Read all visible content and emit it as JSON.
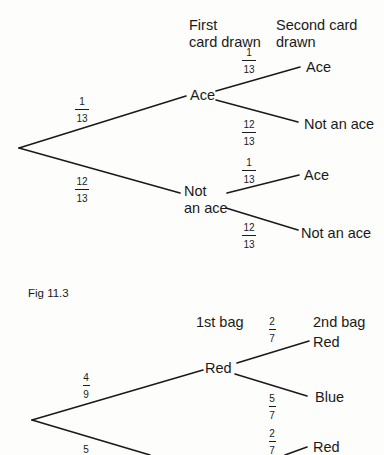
{
  "figure_caption": "Fig 11.3",
  "tree1": {
    "header_first": [
      "First",
      "card drawn"
    ],
    "header_second": [
      "Second card",
      "drawn"
    ],
    "root_branches": [
      {
        "prob_num": "1",
        "prob_den": "13",
        "node": "Ace"
      },
      {
        "prob_num": "12",
        "prob_den": "13",
        "node_line1": "Not",
        "node_line2": "an ace"
      }
    ],
    "ace_children": [
      {
        "prob_num": "1",
        "prob_den": "13",
        "leaf": "Ace"
      },
      {
        "prob_num": "12",
        "prob_den": "13",
        "leaf": "Not an ace"
      }
    ],
    "notace_children": [
      {
        "prob_num": "1",
        "prob_den": "13",
        "leaf": "Ace"
      },
      {
        "prob_num": "12",
        "prob_den": "13",
        "leaf": "Not an ace"
      }
    ]
  },
  "tree2": {
    "header_first": "1st bag",
    "header_second": "2nd bag",
    "root_branches": [
      {
        "prob_num": "4",
        "prob_den": "9",
        "node": "Red"
      },
      {
        "prob_num": "5",
        "prob_den": ""
      }
    ],
    "red_children": [
      {
        "prob_num": "2",
        "prob_den": "7",
        "leaf": "Red"
      },
      {
        "prob_num": "5",
        "prob_den": "7",
        "leaf": "Blue"
      }
    ],
    "second_children": [
      {
        "prob_num": "2",
        "prob_den": "7",
        "leaf": "Red"
      }
    ]
  }
}
